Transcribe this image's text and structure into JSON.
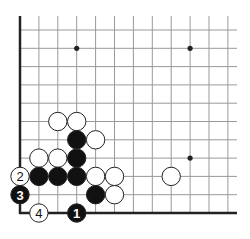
{
  "diagram": {
    "type": "go-board-fragment",
    "corner": "lower-left",
    "grid": {
      "columns": 12,
      "rows": 11,
      "origin_x": 20,
      "origin_y": 30,
      "col_spacing": 18.9,
      "row_spacing": 18.3,
      "right_extent": 237,
      "top_extent": 16,
      "edges": [
        "left",
        "bottom"
      ]
    },
    "colors": {
      "line": "#999999",
      "edge": "#222222",
      "black_stone": "#111111",
      "white_stone": "#ffffff",
      "stone_outline": "#222222"
    },
    "star_points": [
      {
        "col": 3,
        "row": 1
      },
      {
        "col": 9,
        "row": 1
      },
      {
        "col": 9,
        "row": 7
      }
    ],
    "stones": [
      {
        "color": "white",
        "col": 2,
        "row": 5,
        "label": ""
      },
      {
        "color": "white",
        "col": 3,
        "row": 5,
        "label": ""
      },
      {
        "color": "black",
        "col": 3,
        "row": 6,
        "label": ""
      },
      {
        "color": "white",
        "col": 4,
        "row": 6,
        "label": ""
      },
      {
        "color": "white",
        "col": 1,
        "row": 7,
        "label": ""
      },
      {
        "color": "white",
        "col": 2,
        "row": 7,
        "label": ""
      },
      {
        "color": "black",
        "col": 3,
        "row": 7,
        "label": ""
      },
      {
        "color": "black",
        "col": 1,
        "row": 8,
        "label": ""
      },
      {
        "color": "black",
        "col": 2,
        "row": 8,
        "label": ""
      },
      {
        "color": "black",
        "col": 3,
        "row": 8,
        "label": ""
      },
      {
        "color": "white",
        "col": 4,
        "row": 8,
        "label": ""
      },
      {
        "color": "white",
        "col": 5,
        "row": 8,
        "label": ""
      },
      {
        "color": "white",
        "col": 8,
        "row": 8,
        "label": ""
      },
      {
        "color": "black",
        "col": 4,
        "row": 9,
        "label": ""
      },
      {
        "color": "white",
        "col": 5,
        "row": 9,
        "label": ""
      },
      {
        "color": "black",
        "col": 3,
        "row": 10,
        "label": "1"
      },
      {
        "color": "white",
        "col": 0,
        "row": 8,
        "label": "2"
      },
      {
        "color": "black",
        "col": 0,
        "row": 9,
        "label": "3"
      },
      {
        "color": "white",
        "col": 1,
        "row": 10,
        "label": "4"
      }
    ]
  }
}
